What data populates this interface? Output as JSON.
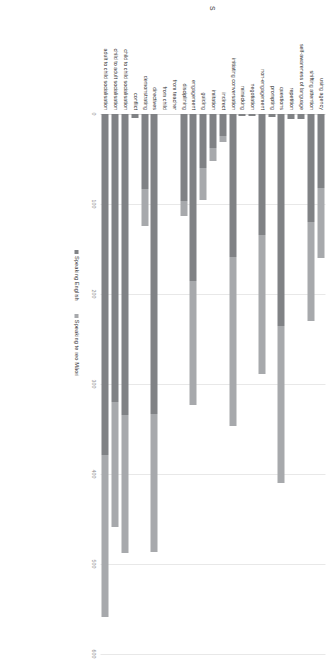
{
  "legend": {
    "position": "bottom-right",
    "items": [
      {
        "label": "Speaking English",
        "color": "#808285",
        "marker": "square-icon"
      },
      {
        "label": "Speaking te reo Māori",
        "color": "#a7a9ac",
        "marker": "square-icon"
      }
    ]
  },
  "axis": {
    "ticks": [
      {
        "value": 0,
        "label": "0"
      },
      {
        "value": 100,
        "label": "100"
      },
      {
        "value": 200,
        "label": "200"
      },
      {
        "value": 300,
        "label": "300"
      },
      {
        "value": 400,
        "label": "400"
      },
      {
        "value": 500,
        "label": "500"
      },
      {
        "value": 600,
        "label": "600"
      }
    ]
  },
  "title_fragment": "s",
  "chart_data": {
    "type": "bar",
    "orientation": "horizontal-rotated",
    "stacked": true,
    "title": "",
    "subtitle": "",
    "xlabel": "",
    "ylabel": "",
    "xlim": [
      0,
      600
    ],
    "grid": true,
    "legend_position": "bottom-right",
    "categories": [
      "using agency",
      "shifting attention",
      "self-awareness of language",
      "repetition",
      "questions",
      "prompting",
      "non-engagement",
      "negotiation",
      "mimicking",
      "initiating conversation",
      "indirect",
      "imitation",
      "guiding",
      "engagement",
      "disciplining",
      "from teacher",
      "from child",
      "directives",
      "demonstrating",
      "conflict",
      "child to child socialisation",
      "child to adult socialisation",
      "adult to child socialisation"
    ],
    "series": [
      {
        "name": "Speaking English",
        "color": "#808285",
        "values": [
          82,
          120,
          6,
          6,
          236,
          3,
          134,
          2,
          2,
          159,
          24,
          38,
          60,
          186,
          97,
          0,
          0,
          333,
          83,
          4,
          334,
          320,
          379
        ]
      },
      {
        "name": "Speaking te reo Māori",
        "color": "#a7a9ac",
        "values": [
          78,
          110,
          0,
          0,
          174,
          0,
          155,
          0,
          0,
          188,
          7,
          14,
          36,
          137,
          16,
          0,
          0,
          154,
          42,
          0,
          154,
          139,
          180
        ]
      }
    ],
    "totals": [
      160,
      230,
      6,
      6,
      410,
      3,
      289,
      2,
      2,
      347,
      31,
      52,
      96,
      323,
      113,
      0,
      0,
      487,
      125,
      4,
      488,
      459,
      559
    ]
  }
}
